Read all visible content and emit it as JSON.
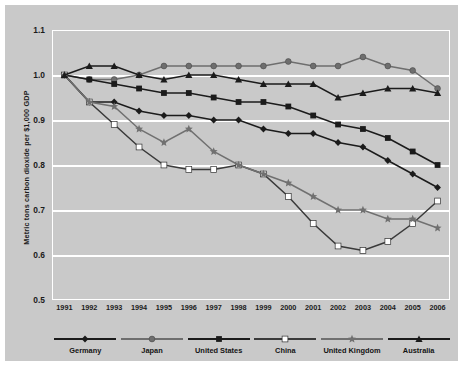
{
  "chart_data": {
    "type": "line",
    "title": "",
    "xlabel": "",
    "ylabel": "Metric tons carbon dioxide per $1,000 GDP",
    "ylim": [
      0.5,
      1.1
    ],
    "yticks": [
      "1.1",
      "1.0",
      "0.9",
      "0.8",
      "0.7",
      "0.6",
      "0.5"
    ],
    "ytick_values": [
      1.1,
      1.0,
      0.9,
      0.8,
      0.7,
      0.6,
      0.5
    ],
    "grid": true,
    "legend_position": "bottom",
    "categories": [
      "1991",
      "1992",
      "1993",
      "1994",
      "1995",
      "1996",
      "1997",
      "1998",
      "1999",
      "2000",
      "2001",
      "2002",
      "2003",
      "2004",
      "2005",
      "2006"
    ],
    "x": [
      1991,
      1992,
      1993,
      1994,
      1995,
      1996,
      1997,
      1998,
      1999,
      2000,
      2001,
      2002,
      2003,
      2004,
      2005,
      2006
    ],
    "series": [
      {
        "name": "Germany",
        "marker": "diamond",
        "color": "#1b1b1b",
        "values": [
          1.0,
          0.94,
          0.94,
          0.92,
          0.91,
          0.91,
          0.9,
          0.9,
          0.88,
          0.87,
          0.87,
          0.85,
          0.84,
          0.81,
          0.78,
          0.75
        ]
      },
      {
        "name": "Japan",
        "marker": "circle-gray",
        "color": "#6e6e6e",
        "values": [
          1.0,
          0.99,
          0.99,
          1.0,
          1.02,
          1.02,
          1.02,
          1.02,
          1.02,
          1.03,
          1.02,
          1.02,
          1.04,
          1.02,
          1.01,
          0.97
        ]
      },
      {
        "name": "United States",
        "marker": "square-black",
        "color": "#1b1b1b",
        "values": [
          1.0,
          0.99,
          0.98,
          0.97,
          0.96,
          0.96,
          0.95,
          0.94,
          0.94,
          0.93,
          0.91,
          0.89,
          0.88,
          0.86,
          0.83,
          0.8
        ]
      },
      {
        "name": "China",
        "marker": "square-white",
        "color": "#3a3a3a",
        "values": [
          1.0,
          0.94,
          0.89,
          0.84,
          0.8,
          0.79,
          0.79,
          0.8,
          0.78,
          0.73,
          0.67,
          0.62,
          0.61,
          0.63,
          0.67,
          0.72
        ]
      },
      {
        "name": "United Kingdom",
        "marker": "star-gray",
        "color": "#707070",
        "values": [
          1.0,
          0.94,
          0.93,
          0.88,
          0.85,
          0.88,
          0.83,
          0.8,
          0.78,
          0.76,
          0.73,
          0.7,
          0.7,
          0.68,
          0.68,
          0.66
        ]
      },
      {
        "name": "Australia",
        "marker": "triangle-black",
        "color": "#1b1b1b",
        "values": [
          1.0,
          1.02,
          1.02,
          1.0,
          0.99,
          1.0,
          1.0,
          0.99,
          0.98,
          0.98,
          0.98,
          0.95,
          0.96,
          0.97,
          0.97,
          0.96
        ]
      }
    ]
  },
  "colors": {
    "figure_background": "#c9c9c9",
    "page_background": "#ffffff",
    "gridline": "#ffffff",
    "dark_series": "#1b1b1b",
    "gray_series": "#6e6e6e",
    "white_marker": "#ffffff"
  }
}
